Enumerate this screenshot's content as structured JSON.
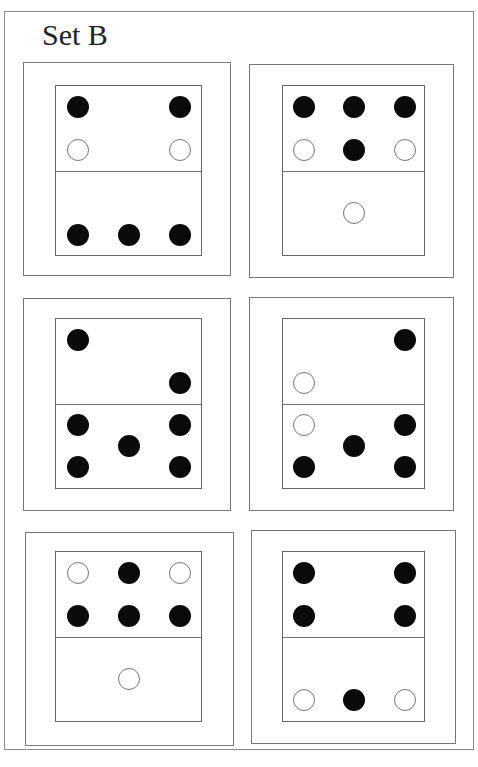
{
  "title": "Set B",
  "colors": {
    "filled": "#0a0a0a",
    "empty_stroke": "#777777",
    "border": "#777777"
  },
  "cards": [
    {
      "id": "card-1",
      "box": [
        23,
        62,
        208,
        214
      ],
      "domino": [
        55,
        85,
        147,
        171
      ],
      "divider_y": 85,
      "top_half": [
        {
          "x": 22,
          "y": 21,
          "type": "filled"
        },
        {
          "x": 124,
          "y": 21,
          "type": "filled"
        },
        {
          "x": 22,
          "y": 64,
          "type": "empty"
        },
        {
          "x": 124,
          "y": 64,
          "type": "empty"
        }
      ],
      "bottom_half": [
        {
          "x": 22,
          "y": 149,
          "type": "filled"
        },
        {
          "x": 73,
          "y": 149,
          "type": "filled"
        },
        {
          "x": 124,
          "y": 149,
          "type": "filled"
        }
      ]
    },
    {
      "id": "card-2",
      "box": [
        249,
        64,
        205,
        214
      ],
      "domino": [
        282,
        85,
        143,
        171
      ],
      "divider_y": 85,
      "top_half": [
        {
          "x": 21,
          "y": 21,
          "type": "filled"
        },
        {
          "x": 71,
          "y": 21,
          "type": "filled"
        },
        {
          "x": 122,
          "y": 21,
          "type": "filled"
        },
        {
          "x": 21,
          "y": 64,
          "type": "empty"
        },
        {
          "x": 71,
          "y": 64,
          "type": "filled"
        },
        {
          "x": 122,
          "y": 64,
          "type": "empty"
        }
      ],
      "bottom_half": [
        {
          "x": 71,
          "y": 127,
          "type": "empty"
        }
      ]
    },
    {
      "id": "card-3",
      "box": [
        23,
        298,
        208,
        213
      ],
      "domino": [
        55,
        318,
        147,
        171
      ],
      "divider_y": 85,
      "top_half": [
        {
          "x": 22,
          "y": 21,
          "type": "filled"
        },
        {
          "x": 124,
          "y": 64,
          "type": "filled"
        }
      ],
      "bottom_half": [
        {
          "x": 22,
          "y": 106,
          "type": "filled"
        },
        {
          "x": 124,
          "y": 106,
          "type": "filled"
        },
        {
          "x": 73,
          "y": 127,
          "type": "filled"
        },
        {
          "x": 22,
          "y": 148,
          "type": "filled"
        },
        {
          "x": 124,
          "y": 148,
          "type": "filled"
        }
      ]
    },
    {
      "id": "card-4",
      "box": [
        249,
        297,
        205,
        214
      ],
      "domino": [
        282,
        318,
        143,
        171
      ],
      "divider_y": 85,
      "top_half": [
        {
          "x": 122,
          "y": 21,
          "type": "filled"
        },
        {
          "x": 21,
          "y": 64,
          "type": "empty"
        }
      ],
      "bottom_half": [
        {
          "x": 21,
          "y": 106,
          "type": "empty"
        },
        {
          "x": 122,
          "y": 106,
          "type": "filled"
        },
        {
          "x": 71,
          "y": 127,
          "type": "filled"
        },
        {
          "x": 21,
          "y": 148,
          "type": "filled"
        },
        {
          "x": 122,
          "y": 148,
          "type": "filled"
        }
      ]
    },
    {
      "id": "card-5",
      "box": [
        25,
        532,
        209,
        214
      ],
      "domino": [
        55,
        551,
        147,
        171
      ],
      "divider_y": 85,
      "top_half": [
        {
          "x": 22,
          "y": 21,
          "type": "empty"
        },
        {
          "x": 73,
          "y": 21,
          "type": "filled"
        },
        {
          "x": 124,
          "y": 21,
          "type": "empty"
        },
        {
          "x": 22,
          "y": 64,
          "type": "filled"
        },
        {
          "x": 73,
          "y": 64,
          "type": "filled"
        },
        {
          "x": 124,
          "y": 64,
          "type": "filled"
        }
      ],
      "bottom_half": [
        {
          "x": 73,
          "y": 127,
          "type": "empty"
        }
      ]
    },
    {
      "id": "card-6",
      "box": [
        251,
        530,
        205,
        214
      ],
      "domino": [
        282,
        551,
        143,
        171
      ],
      "divider_y": 85,
      "top_half": [
        {
          "x": 21,
          "y": 21,
          "type": "filled"
        },
        {
          "x": 122,
          "y": 21,
          "type": "filled"
        },
        {
          "x": 21,
          "y": 64,
          "type": "filled"
        },
        {
          "x": 122,
          "y": 64,
          "type": "filled"
        }
      ],
      "bottom_half": [
        {
          "x": 21,
          "y": 148,
          "type": "empty"
        },
        {
          "x": 71,
          "y": 148,
          "type": "filled"
        },
        {
          "x": 122,
          "y": 148,
          "type": "empty"
        }
      ]
    }
  ]
}
